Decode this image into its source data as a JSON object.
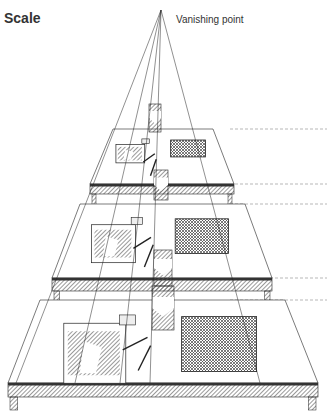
{
  "title": "Scale",
  "vanishing_point": {
    "label": "Vanishing point",
    "x": 161,
    "y": 10
  },
  "colors": {
    "ink": "#222222",
    "hatch": "#555555",
    "guide": "#888888",
    "paper": "#ffffff"
  },
  "tables": [
    {
      "name": "far",
      "back": {
        "y": 129,
        "x1": 113,
        "x2": 213
      },
      "front": {
        "y": 184,
        "x1": 90,
        "x2": 234
      },
      "skirt_bottom": 194,
      "leg_bottom": 205
    },
    {
      "name": "middle",
      "back": {
        "y": 204,
        "x1": 80,
        "x2": 245
      },
      "front": {
        "y": 278,
        "x1": 52,
        "x2": 272
      },
      "skirt_bottom": 291,
      "leg_bottom": 302
    },
    {
      "name": "near",
      "back": {
        "y": 300,
        "x1": 40,
        "x2": 285
      },
      "front": {
        "y": 383,
        "x1": 8,
        "x2": 318
      },
      "skirt_bottom": 397,
      "leg_bottom": 410
    }
  ],
  "guide_lines_y": [
    129,
    184,
    204,
    278,
    300
  ]
}
